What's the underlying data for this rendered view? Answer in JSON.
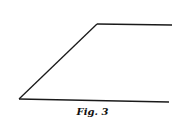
{
  "figure": {
    "caption": "Fig. 3",
    "stroke_color": "#1a1a1a",
    "lines": [
      {
        "name": "slanted-edge",
        "x1": 19,
        "y1": 99,
        "x2": 97,
        "y2": 24
      },
      {
        "name": "top-edge",
        "x1": 97,
        "y1": 24,
        "x2": 172,
        "y2": 25
      },
      {
        "name": "bottom-edge",
        "x1": 19,
        "y1": 99,
        "x2": 169,
        "y2": 102
      }
    ]
  }
}
